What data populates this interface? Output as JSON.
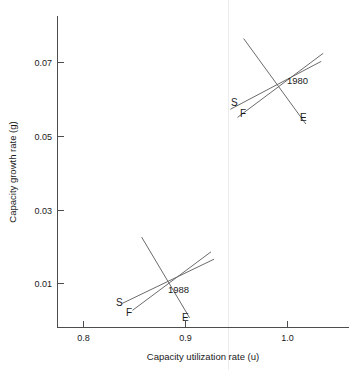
{
  "chart_data": {
    "type": "line",
    "title": "",
    "xlabel": "Capacity utilization rate (u)",
    "ylabel": "Capacity growth rate (g)",
    "xlim": [
      0.765,
      1.055
    ],
    "ylim": [
      0.0,
      0.0785
    ],
    "xticks": [
      0.8,
      0.9,
      1.0
    ],
    "xticklabels": [
      "0.8",
      "0.9",
      "1.0"
    ],
    "yticks": [
      0.01,
      0.03,
      0.05,
      0.07
    ],
    "yticklabels": [
      "0.01",
      "0.03",
      "0.05",
      "0.07"
    ],
    "grid": false,
    "legend": "none",
    "annotations": [
      "1980",
      "1988"
    ],
    "clusters": [
      {
        "name": "1980",
        "label": "1980",
        "equilibrium": {
          "u": 0.99,
          "g": 0.0633
        },
        "curves": [
          {
            "name": "E",
            "label": "E",
            "points": [
              {
                "u": 0.957,
                "g": 0.0765
              },
              {
                "u": 1.018,
                "g": 0.0533
              }
            ]
          },
          {
            "name": "S",
            "label": "S",
            "points": [
              {
                "u": 0.944,
                "g": 0.0573
              },
              {
                "u": 1.033,
                "g": 0.0703
              }
            ]
          },
          {
            "name": "F",
            "label": "F",
            "points": [
              {
                "u": 0.951,
                "g": 0.0551
              },
              {
                "u": 1.035,
                "g": 0.0725
              }
            ]
          }
        ]
      },
      {
        "name": "1988",
        "label": "1988",
        "equilibrium": {
          "u": 0.885,
          "g": 0.0105
        },
        "curves": [
          {
            "name": "E",
            "label": "E",
            "points": [
              {
                "u": 0.857,
                "g": 0.0226
              },
              {
                "u": 0.904,
                "g": 0.0007
              }
            ]
          },
          {
            "name": "S",
            "label": "S",
            "points": [
              {
                "u": 0.838,
                "g": 0.0046
              },
              {
                "u": 0.928,
                "g": 0.0166
              }
            ]
          },
          {
            "name": "F",
            "label": "F",
            "points": [
              {
                "u": 0.848,
                "g": 0.0027
              },
              {
                "u": 0.925,
                "g": 0.0186
              }
            ]
          }
        ]
      }
    ]
  },
  "axes": {
    "x_title": "Capacity utilization rate (u)",
    "y_title": "Capacity growth rate (g)",
    "x_tick_labels": [
      "0.8",
      "0.9",
      "1.0"
    ],
    "y_tick_labels": [
      "0.07",
      "0.05",
      "0.03",
      "0.01"
    ]
  },
  "cluster_1980": {
    "year": "1980",
    "label_s": "S",
    "label_f": "F",
    "label_e": "E"
  },
  "cluster_1988": {
    "year": "1988",
    "label_s": "S",
    "label_f": "F",
    "label_e": "E"
  },
  "colors": {
    "background": "#ffffff",
    "axis": "#4d4d4d",
    "curve": "#6b6b6b",
    "text": "#1a1a1a",
    "faint_rule": "#ececec"
  }
}
